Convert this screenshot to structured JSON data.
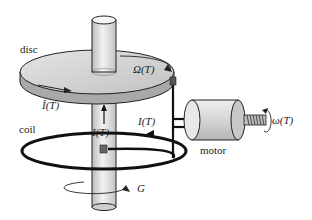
{
  "diagram": {
    "labels": {
      "disc": "disc",
      "omega_big": "Ω(T)",
      "i_hat": "Î(T)",
      "coil": "coil",
      "current_shaft": "I(T)",
      "current_coil": "I(T)",
      "motor": "motor",
      "omega_small": "ω(T)",
      "g": "G"
    },
    "colors": {
      "stroke": "#111111",
      "disc_fill": "#cfcfcf",
      "disc_rim": "#a8a8a8",
      "shaft_fill": "#e6e6e6",
      "motor_fill": "#d8d8d8",
      "coil": "#111111"
    }
  }
}
